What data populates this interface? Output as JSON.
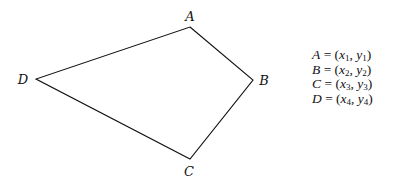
{
  "diagram": {
    "type": "quadrilateral",
    "vertices": [
      {
        "name": "A",
        "x": 190,
        "y": 27,
        "label_x": 190,
        "label_y": 21
      },
      {
        "name": "B",
        "x": 253,
        "y": 80,
        "label_x": 264,
        "label_y": 85
      },
      {
        "name": "C",
        "x": 190,
        "y": 159,
        "label_x": 189,
        "label_y": 176
      },
      {
        "name": "D",
        "x": 36,
        "y": 79,
        "label_x": 23,
        "label_y": 84
      }
    ],
    "edges": [
      [
        "A",
        "B"
      ],
      [
        "B",
        "C"
      ],
      [
        "C",
        "D"
      ],
      [
        "D",
        "A"
      ]
    ],
    "stroke_color": "#111111",
    "equations": [
      {
        "lhs": "A",
        "x": "x",
        "xi": "1",
        "y": "y",
        "yi": "1"
      },
      {
        "lhs": "B",
        "x": "x",
        "xi": "2",
        "y": "y",
        "yi": "2"
      },
      {
        "lhs": "C",
        "x": "x",
        "xi": "3",
        "y": "y",
        "yi": "3"
      },
      {
        "lhs": "D",
        "x": "x",
        "xi": "4",
        "y": "y",
        "yi": "4"
      }
    ]
  }
}
